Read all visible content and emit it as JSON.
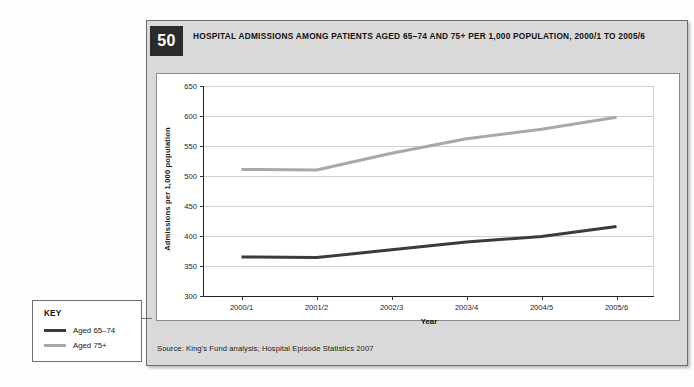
{
  "figure": {
    "number": "50",
    "title": "HOSPITAL ADMISSIONS AMONG PATIENTS AGED 65–74 AND 75+ PER 1,000 POPULATION, 2000/1 TO 2005/6",
    "source": "Source: King's Fund analysis; Hospital Episode Statistics 2007"
  },
  "key": {
    "title": "KEY",
    "items": [
      {
        "label": "Aged 65–74",
        "color": "#3b3b3b"
      },
      {
        "label": "Aged 75+",
        "color": "#a8a8a8"
      }
    ]
  },
  "chart_data": {
    "type": "line",
    "title": "HOSPITAL ADMISSIONS AMONG PATIENTS AGED 65–74 AND 75+ PER 1,000 POPULATION, 2000/1 TO 2005/6",
    "xlabel": "Year",
    "ylabel": "Admissions per 1,000 population",
    "categories": [
      "2000/1",
      "2001/2",
      "2002/3",
      "2003/4",
      "2004/5",
      "2005/6"
    ],
    "ylim": [
      300,
      650
    ],
    "yticks": [
      300,
      350,
      400,
      450,
      500,
      550,
      600,
      650
    ],
    "grid": true,
    "legend_position": "external-key-box",
    "series": [
      {
        "name": "Aged 65–74",
        "color": "#3b3b3b",
        "values": [
          365,
          364,
          377,
          390,
          399,
          416
        ]
      },
      {
        "name": "Aged 75+",
        "color": "#a8a8a8",
        "values": [
          511,
          510,
          538,
          562,
          578,
          598
        ]
      }
    ]
  }
}
